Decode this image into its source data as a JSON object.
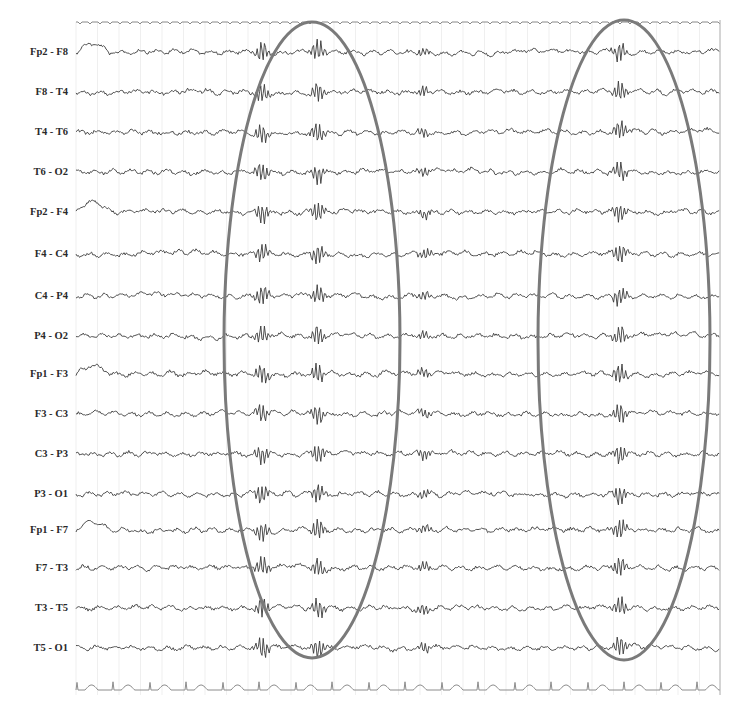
{
  "figure": {
    "type": "eeg-bipolar-montage",
    "trace_color": "#3a3a3a",
    "spike_color": "#8a8a8a",
    "ellipse_color": "#7a7a7a",
    "grid_color": "#e4e4e4",
    "ecg_color": "#8c8c8c",
    "plot_left": 76,
    "plot_right": 720,
    "top_marker_y": 22,
    "ecg_y": 690
  },
  "channels": [
    {
      "label": "Fp2 - F8",
      "y": 52
    },
    {
      "label": "F8 - T4",
      "y": 92
    },
    {
      "label": "T4 - T6",
      "y": 132
    },
    {
      "label": "T6 - O2",
      "y": 172
    },
    {
      "label": "Fp2 - F4",
      "y": 212
    },
    {
      "label": "F4 - C4",
      "y": 254
    },
    {
      "label": "C4 - P4",
      "y": 296
    },
    {
      "label": "P4 - O2",
      "y": 336
    },
    {
      "label": "Fp1 - F3",
      "y": 374
    },
    {
      "label": "F3 - C3",
      "y": 414
    },
    {
      "label": "C3 - P3",
      "y": 454
    },
    {
      "label": "P3 - O1",
      "y": 494
    },
    {
      "label": "Fp1 - F7",
      "y": 530
    },
    {
      "label": "F7 - T3",
      "y": 568
    },
    {
      "label": "T3 - T5",
      "y": 608
    },
    {
      "label": "T5 - O1",
      "y": 648
    }
  ],
  "annotations": [
    {
      "name": "discharge-ellipse-1",
      "cx": 312,
      "cy": 340,
      "rx": 88,
      "ry": 318
    },
    {
      "name": "discharge-ellipse-2",
      "cx": 624,
      "cy": 340,
      "rx": 86,
      "ry": 320
    }
  ],
  "discharge_times_x": [
    262,
    318,
    424,
    620
  ]
}
